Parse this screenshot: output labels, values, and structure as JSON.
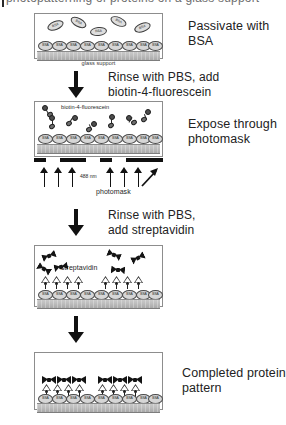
{
  "figure": {
    "type": "process-schematic",
    "title_sliver": "photopatterning of proteins on a glass support",
    "background": "#ffffff",
    "ink": "#1a1a1a"
  },
  "steps": [
    {
      "id": "step-1",
      "side_label": "Passivate with BSA",
      "panel_caption": "glass support",
      "inner_labels": [],
      "molecule_tag": "BSA",
      "free_molecules": 5,
      "monolayer_count": 9
    },
    {
      "id": "step-2",
      "side_label": "Expose through\nphotomask",
      "panel_caption": "",
      "inner_labels": [
        "biotin-4-fluorescein",
        "488 nm",
        "photomask"
      ],
      "molecule_tag": "BSA",
      "free_molecules": 7,
      "monolayer_count": 9,
      "illumination_arrows": 6,
      "wavelength": "488 nm"
    },
    {
      "id": "step-3",
      "side_label": "",
      "panel_caption": "",
      "inner_labels": [
        "streptavidin"
      ],
      "molecule_tag": "BSA",
      "free_molecules": 6,
      "monolayer_count": 9,
      "bound_biotin_clusters": [
        4,
        4
      ]
    },
    {
      "id": "step-4",
      "side_label": "Completed protein\npattern",
      "panel_caption": "",
      "inner_labels": [],
      "molecule_tag": "BSA",
      "free_molecules": 0,
      "monolayer_count": 9,
      "bound_streptavidin_clusters": [
        3,
        4
      ]
    }
  ],
  "transitions": [
    {
      "id": "transition-1",
      "label": "Rinse with PBS, add\nbiotin-4-fluorescein"
    },
    {
      "id": "transition-2",
      "label": "Rinse with PBS,\nadd streptavidin"
    },
    {
      "id": "transition-3",
      "label": ""
    }
  ],
  "labels": {
    "bsa_tag": "BSA",
    "glass_support": "glass support",
    "biotin_fluorescein": "biotin-4-fluorescein",
    "wavelength": "488 nm",
    "photomask": "photomask",
    "streptavidin": "streptavidin",
    "passivate": "Passivate with BSA",
    "expose": "Expose through\nphotomask",
    "completed": "Completed protein\npattern"
  },
  "colors": {
    "panel_border": "#8d8d8d",
    "glass_fill": "#bdbdbd",
    "bsa_fill": "#d6d6d6",
    "molecule_dark": "#141414",
    "arrow": "#111111"
  }
}
